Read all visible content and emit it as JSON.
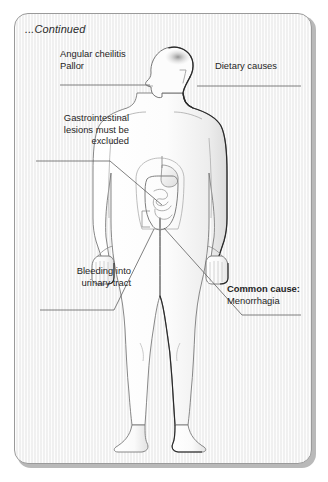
{
  "figure": {
    "header": "...Continued",
    "title_note": "Anaemia clinical signs — continued",
    "background_color": "#f3f3f3",
    "frame_color": "#9a9a9a",
    "body_fill": "#fbfbfb",
    "outline_color": "#6f6f6f",
    "shadow_color": "#1a1a1a",
    "leader_color": "#555555"
  },
  "labels": {
    "angular_cheilitis": {
      "line1": "Angular cheilitis",
      "line2": "Pallor",
      "align": "left",
      "target": "mouth"
    },
    "dietary_causes": {
      "text": "Dietary causes",
      "align": "left",
      "target": "head"
    },
    "gastrointestinal": {
      "line1": "Gastrointestinal",
      "line2": "lesions must be",
      "line3": "excluded",
      "align": "right",
      "target": "intestines"
    },
    "bleeding_urinary": {
      "line1": "Bleeding into",
      "line2": "urinary tract",
      "align": "right",
      "target": "bladder"
    },
    "common_cause": {
      "line1_bold": "Common cause:",
      "line2": "Menorrhagia",
      "align": "left",
      "target": "pelvis"
    }
  },
  "anatomy": {
    "parts": [
      "head-profile",
      "neck",
      "torso",
      "left-arm",
      "right-arm",
      "left-hand",
      "right-hand",
      "left-leg",
      "right-leg",
      "left-foot",
      "right-foot",
      "stomach",
      "large-intestine",
      "small-intestine",
      "scalp-shading"
    ]
  }
}
